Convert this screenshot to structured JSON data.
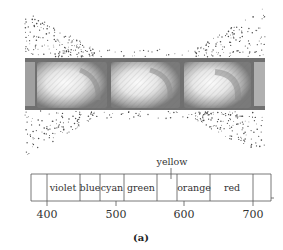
{
  "figure": {
    "caption": "(a)",
    "illustration": {
      "description": "prism-like glass cells in a strip with scattered light dots above and below",
      "cell_count_full": 3
    },
    "spectrum": {
      "bands": [
        {
          "label": "",
          "x0": 31,
          "x1": 47
        },
        {
          "label": "violet",
          "x0": 47,
          "x1": 80
        },
        {
          "label": "blue",
          "x0": 80,
          "x1": 100
        },
        {
          "label": "cyan",
          "x0": 100,
          "x1": 124
        },
        {
          "label": "green",
          "x0": 124,
          "x1": 157
        },
        {
          "label": "",
          "x0": 157,
          "x1": 177
        },
        {
          "label": "orange",
          "x0": 177,
          "x1": 210
        },
        {
          "label": "red",
          "x0": 210,
          "x1": 253
        },
        {
          "label": "",
          "x0": 253,
          "x1": 271
        }
      ],
      "yellow_label": "yellow",
      "ticks": [
        {
          "label": "400",
          "x": 47
        },
        {
          "label": "500",
          "x": 116
        },
        {
          "label": "600",
          "x": 184
        },
        {
          "label": "700",
          "x": 253
        }
      ]
    },
    "colors": {
      "line": "#555555",
      "strip_dark": "#5a5a5a",
      "strip_mid": "#8c8c8c",
      "cell_light": "#f2f2f2",
      "dots": "#4a4a4a"
    }
  }
}
